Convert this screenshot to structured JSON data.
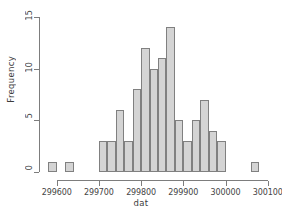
{
  "chart_data": {
    "type": "bar",
    "title": "",
    "xlabel": "dat",
    "ylabel": "Frequency",
    "xlim": [
      299570,
      300110
    ],
    "ylim": [
      0,
      15.2
    ],
    "bin_width": 20,
    "grid": false,
    "legend": false,
    "bar_fill": "#d4d4d4",
    "bar_border": "#808080",
    "axis_color": "#7d7d7d",
    "bin_starts": [
      299580,
      299600,
      299620,
      299640,
      299660,
      299680,
      299700,
      299720,
      299740,
      299760,
      299780,
      299800,
      299820,
      299840,
      299860,
      299880,
      299900,
      299920,
      299940,
      299960,
      299980,
      300000,
      300020,
      300040,
      300060
    ],
    "categories": [
      "299580-299600",
      "299600-299620",
      "299620-299640",
      "299640-299660",
      "299660-299680",
      "299680-299700",
      "299700-299720",
      "299720-299740",
      "299740-299760",
      "299760-299780",
      "299780-299800",
      "299800-299820",
      "299820-299840",
      "299840-299860",
      "299860-299880",
      "299880-299900",
      "299900-299920",
      "299920-299940",
      "299940-299960",
      "299960-299980",
      "299980-300000",
      "300000-300020",
      "300020-300040",
      "300040-300060",
      "300060-300080"
    ],
    "values": [
      1,
      0,
      1,
      0,
      0,
      0,
      3,
      3,
      6,
      3,
      8,
      12,
      10,
      11,
      14,
      5,
      3,
      5,
      7,
      4,
      3,
      0,
      0,
      0,
      1
    ],
    "xticks": [
      299600,
      299700,
      299800,
      299900,
      300000,
      300100
    ],
    "xtick_labels": [
      "299600",
      "299700",
      "299800",
      "299900",
      "300000",
      "300100"
    ],
    "yticks": [
      0,
      5,
      10,
      15
    ],
    "ytick_labels": [
      "0",
      "5",
      "10",
      "15"
    ]
  }
}
